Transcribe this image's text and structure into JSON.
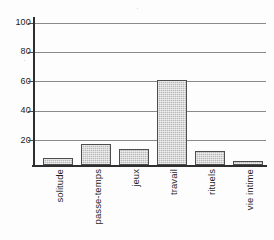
{
  "chart_data": {
    "type": "bar",
    "title": "",
    "subtitle": "",
    "xlabel": "",
    "ylabel": "",
    "categories": [
      "solitude",
      "passe-temps",
      "jeux",
      "travail",
      "rituels",
      "vie intime"
    ],
    "values": [
      5,
      15,
      11,
      60,
      10,
      3
    ],
    "series": [
      {
        "name": "",
        "values": [
          5,
          15,
          11,
          60,
          10,
          3
        ]
      }
    ],
    "ylim": [
      0,
      100
    ],
    "xlim": [
      0,
      6
    ],
    "yticks": [
      20,
      40,
      60,
      80,
      100
    ],
    "ytick_labels": [
      "20",
      "40",
      "60",
      "80",
      "100"
    ],
    "grid": "horizontal",
    "legend": "none",
    "annotations": [],
    "colors": {
      "bar_fill": "#b9b9b9",
      "bar_edge": "#4d4d4d",
      "gridline": "#8a8a8a",
      "axis": "#2e2e2e",
      "text": "#1f1f1f",
      "background": "#fdfdfd"
    }
  }
}
